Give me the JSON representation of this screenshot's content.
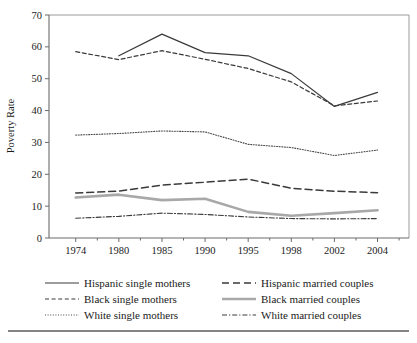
{
  "chart_data": {
    "type": "line",
    "title": "",
    "xlabel": "",
    "ylabel": "Poverty Rate",
    "categories": [
      "1974",
      "1980",
      "1985",
      "1990",
      "1995",
      "1998",
      "2002",
      "2004"
    ],
    "ylim": [
      0,
      70
    ],
    "y_ticks": [
      "0",
      "10",
      "20",
      "30",
      "40",
      "50",
      "60",
      "70"
    ],
    "grid": false,
    "legend_position": "bottom",
    "series": [
      {
        "name": "Hispanic single mothers",
        "style": "solid",
        "color": "#3a3a3a",
        "width": 1.2,
        "values": [
          null,
          57.2,
          64.0,
          58.2,
          57.2,
          51.6,
          41.3,
          45.7
        ]
      },
      {
        "name": "Black single mothers",
        "style": "dashed",
        "color": "#3a3a3a",
        "width": 1.2,
        "values": [
          58.5,
          56.0,
          58.8,
          56.1,
          53.2,
          49.0,
          41.5,
          43.0
        ]
      },
      {
        "name": "White single mothers",
        "style": "dotted",
        "color": "#4a4a4a",
        "width": 1.1,
        "values": [
          32.3,
          32.8,
          33.6,
          33.3,
          29.4,
          28.4,
          25.9,
          27.6
        ]
      },
      {
        "name": "Hispanic married couples",
        "style": "dashed-long",
        "color": "#3a3a3a",
        "width": 1.5,
        "values": [
          14.1,
          14.7,
          16.6,
          17.5,
          18.5,
          15.6,
          14.7,
          14.2
        ]
      },
      {
        "name": "Black married couples",
        "style": "solid-thick",
        "color": "#a8a8a8",
        "width": 2.6,
        "values": [
          12.7,
          13.6,
          11.9,
          12.3,
          8.2,
          7.0,
          7.8,
          8.7
        ]
      },
      {
        "name": "White married couples",
        "style": "dash-dot",
        "color": "#3a3a3a",
        "width": 1.1,
        "values": [
          6.2,
          6.8,
          7.8,
          7.4,
          6.6,
          6.1,
          6.0,
          6.1
        ]
      }
    ]
  },
  "legend": {
    "entries": [
      {
        "label": "Hispanic single mothers",
        "style": "solid"
      },
      {
        "label": "Hispanic married couples",
        "style": "dashed-long"
      },
      {
        "label": "Black single mothers",
        "style": "dashed"
      },
      {
        "label": "Black married couples",
        "style": "solid-thick"
      },
      {
        "label": "White single mothers",
        "style": "dotted"
      },
      {
        "label": "White married couples",
        "style": "dash-dot"
      }
    ]
  }
}
